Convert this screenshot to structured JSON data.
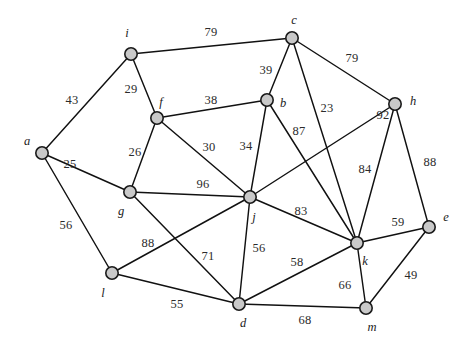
{
  "figure": {
    "kind": "undirected-weighted-graph",
    "background_color": "#ffffff",
    "node_fill_color": "#c9c9c9",
    "node_stroke_color": "#1a1a1a",
    "edge_color": "#111111",
    "label_color": "#1a1a1a",
    "weight_color": "#2b2b2b",
    "width": 469,
    "height": 345
  },
  "chart_data": {
    "type": "diagram",
    "title": "",
    "xlabel": "",
    "ylabel": "",
    "nodes": [
      {
        "id": "a",
        "label": "a",
        "x": 42,
        "y": 153,
        "label_x": 27,
        "label_y": 141
      },
      {
        "id": "b",
        "label": "b",
        "x": 267,
        "y": 100,
        "label_x": 283,
        "label_y": 103
      },
      {
        "id": "c",
        "label": "c",
        "x": 292,
        "y": 38,
        "label_x": 294,
        "label_y": 20
      },
      {
        "id": "d",
        "label": "d",
        "x": 239,
        "y": 304,
        "label_x": 243,
        "label_y": 323
      },
      {
        "id": "e",
        "label": "e",
        "x": 429,
        "y": 227,
        "label_x": 446,
        "label_y": 217
      },
      {
        "id": "f",
        "label": "f",
        "x": 157,
        "y": 118,
        "label_x": 161,
        "label_y": 102
      },
      {
        "id": "g",
        "label": "g",
        "x": 130,
        "y": 192,
        "label_x": 121,
        "label_y": 211
      },
      {
        "id": "h",
        "label": "h",
        "x": 395,
        "y": 104,
        "label_x": 413,
        "label_y": 101
      },
      {
        "id": "i",
        "label": "i",
        "x": 131,
        "y": 54,
        "label_x": 127,
        "label_y": 33
      },
      {
        "id": "j",
        "label": "j",
        "x": 250,
        "y": 197,
        "label_x": 254,
        "label_y": 217
      },
      {
        "id": "k",
        "label": "k",
        "x": 357,
        "y": 243,
        "label_x": 365,
        "label_y": 261
      },
      {
        "id": "l",
        "label": "l",
        "x": 112,
        "y": 273,
        "label_x": 103,
        "label_y": 293
      },
      {
        "id": "m",
        "label": "m",
        "x": 366,
        "y": 308,
        "label_x": 372,
        "label_y": 327
      }
    ],
    "edges": [
      {
        "source": "a",
        "target": "i",
        "weight": 43,
        "label_x": 72,
        "label_y": 100
      },
      {
        "source": "a",
        "target": "g",
        "weight": 25,
        "label_x": 70,
        "label_y": 164
      },
      {
        "source": "a",
        "target": "l",
        "weight": 56,
        "label_x": 66,
        "label_y": 225
      },
      {
        "source": "i",
        "target": "f",
        "weight": 29,
        "label_x": 131,
        "label_y": 89
      },
      {
        "source": "i",
        "target": "c",
        "weight": 79,
        "label_x": 211,
        "label_y": 32
      },
      {
        "source": "f",
        "target": "b",
        "weight": 38,
        "label_x": 211,
        "label_y": 100
      },
      {
        "source": "f",
        "target": "g",
        "weight": 26,
        "label_x": 135,
        "label_y": 152
      },
      {
        "source": "f",
        "target": "j",
        "weight": 30,
        "label_x": 209,
        "label_y": 147
      },
      {
        "source": "c",
        "target": "b",
        "weight": 39,
        "label_x": 266,
        "label_y": 70
      },
      {
        "source": "c",
        "target": "h",
        "weight": 79,
        "label_x": 352,
        "label_y": 58
      },
      {
        "source": "c",
        "target": "k",
        "weight": 23,
        "label_x": 327,
        "label_y": 108
      },
      {
        "source": "b",
        "target": "j",
        "weight": 34,
        "label_x": 246,
        "label_y": 146
      },
      {
        "source": "b",
        "target": "k",
        "weight": 87,
        "label_x": 299,
        "label_y": 131
      },
      {
        "source": "h",
        "target": "j",
        "weight": 92,
        "label_x": 383,
        "label_y": 115
      },
      {
        "source": "h",
        "target": "k",
        "weight": 84,
        "label_x": 365,
        "label_y": 169
      },
      {
        "source": "h",
        "target": "e",
        "weight": 88,
        "label_x": 430,
        "label_y": 162
      },
      {
        "source": "g",
        "target": "j",
        "weight": 96,
        "label_x": 203,
        "label_y": 184
      },
      {
        "source": "g",
        "target": "d",
        "weight": 71,
        "label_x": 208,
        "label_y": 256
      },
      {
        "source": "l",
        "target": "j",
        "weight": 88,
        "label_x": 148,
        "label_y": 243
      },
      {
        "source": "l",
        "target": "d",
        "weight": 55,
        "label_x": 177,
        "label_y": 304
      },
      {
        "source": "j",
        "target": "d",
        "weight": 56,
        "label_x": 259,
        "label_y": 248
      },
      {
        "source": "j",
        "target": "k",
        "weight": 83,
        "label_x": 301,
        "label_y": 211
      },
      {
        "source": "d",
        "target": "k",
        "weight": 58,
        "label_x": 297,
        "label_y": 262
      },
      {
        "source": "d",
        "target": "m",
        "weight": 68,
        "label_x": 305,
        "label_y": 320
      },
      {
        "source": "k",
        "target": "e",
        "weight": 59,
        "label_x": 398,
        "label_y": 222
      },
      {
        "source": "k",
        "target": "m",
        "weight": 66,
        "label_x": 345,
        "label_y": 285
      },
      {
        "source": "m",
        "target": "e",
        "weight": 49,
        "label_x": 411,
        "label_y": 275
      }
    ]
  }
}
